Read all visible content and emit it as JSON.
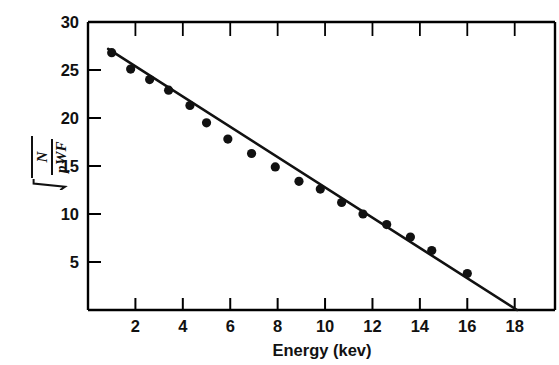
{
  "figure": {
    "name": "fermi-kurie-plot",
    "background_color": "#ffffff",
    "line_color": "#111111",
    "marker_color": "#111111",
    "axis_color": "#000000"
  },
  "ylabel": {
    "expression": "sqrt(N/(pWF))",
    "numerator": "N",
    "denominator": "pWF",
    "radical_symbol": "√"
  },
  "chart_data": {
    "type": "scatter",
    "title": "",
    "subtitle": "",
    "xlabel": "Energy (kev)",
    "ylabel": "sqrt(N/(pWF))",
    "xlim": [
      0,
      19.7
    ],
    "ylim": [
      0,
      30
    ],
    "grid": false,
    "legend": null,
    "x_major_ticks": [
      2,
      4,
      6,
      8,
      10,
      12,
      14,
      16,
      18
    ],
    "x_tick_labels": [
      "2",
      "4",
      "6",
      "8",
      "10",
      "12",
      "14",
      "16",
      "18"
    ],
    "y_major_ticks": [
      5,
      10,
      15,
      20,
      25,
      30
    ],
    "y_tick_labels": [
      "5",
      "10",
      "15",
      "20",
      "25",
      "30"
    ],
    "top_axis_ticks": true,
    "tick_direction": "in",
    "series": [
      {
        "name": "measured points",
        "marker": "filled-circle",
        "x": [
          1.0,
          1.8,
          2.6,
          3.4,
          4.3,
          5.0,
          5.9,
          6.9,
          7.9,
          8.9,
          9.8,
          10.7,
          11.6,
          12.6,
          13.6,
          14.5,
          16.0
        ],
        "y": [
          26.8,
          25.1,
          24.0,
          22.9,
          21.3,
          19.5,
          17.8,
          16.3,
          14.9,
          13.4,
          12.6,
          11.2,
          10.0,
          8.9,
          7.6,
          6.2,
          3.8
        ]
      },
      {
        "name": "linear fit",
        "type": "line",
        "x_endpoints": [
          0.85,
          18.1
        ],
        "y_endpoints": [
          27.2,
          0.0
        ],
        "x_intercept": 18.0,
        "y_intercept": 28.5,
        "slope": -1.583
      }
    ]
  }
}
